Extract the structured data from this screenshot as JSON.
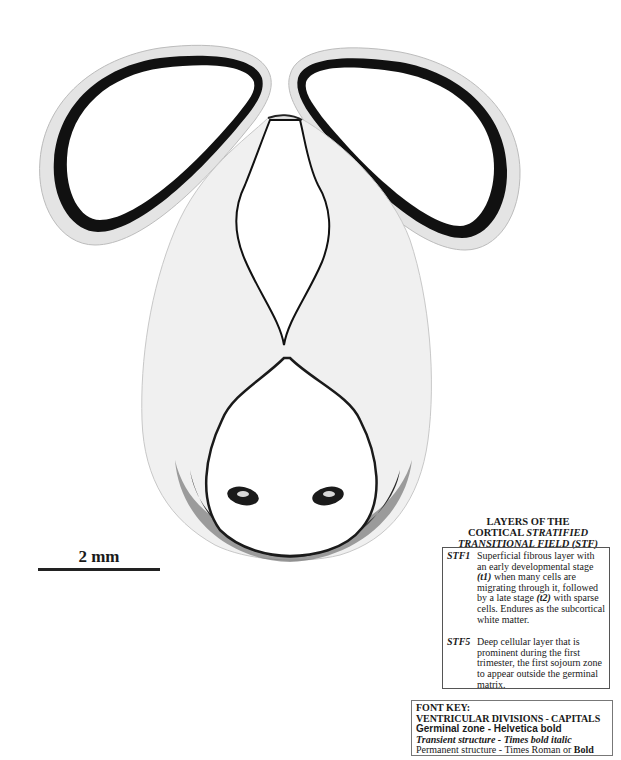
{
  "figure": {
    "scale_bar": {
      "label": "2 mm"
    }
  },
  "legend": {
    "title_line1": "LAYERS OF THE",
    "title_line2_plain": "CORTICAL ",
    "title_line2_italic": "STRATIFIED",
    "title_line3": "TRANSITIONAL FIELD (STF)",
    "items": [
      {
        "code": "STF1",
        "text_a": "Superficial fibrous layer with an early developmental stage ",
        "term1": "(t1)",
        "text_b": " when many cells are migrating through it, followed by a late stage ",
        "term2": "(t2)",
        "text_c": " with sparse cells.  Endures as the subcortical white matter."
      },
      {
        "code": "STF5",
        "text": "Deep cellular layer that is prominent during the first trimester, the first sojourn zone to appear outside the germinal matrix."
      }
    ]
  },
  "font_key": {
    "title": "FONT KEY:",
    "ventricular": "VENTRICULAR DIVISIONS - CAPITALS",
    "germinal": "Germinal zone - Helvetica bold",
    "transient": "Transient structure - Times bold italic",
    "permanent_plain": "Permanent structure - Times Roman or ",
    "permanent_bold": "Bold"
  }
}
